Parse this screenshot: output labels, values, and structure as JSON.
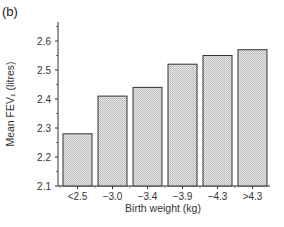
{
  "panel_label": "(b)",
  "chart_data": {
    "type": "bar",
    "title": "",
    "xlabel": "Birth weight (kg)",
    "ylabel": "Mean FEV₁ (litres)",
    "categories": [
      "<2.5",
      "−3.0",
      "−3.4",
      "−3.9",
      "−4.3",
      ">4.3"
    ],
    "values": [
      2.28,
      2.41,
      2.44,
      2.52,
      2.55,
      2.57
    ],
    "ylim": [
      2.1,
      2.65
    ],
    "yticks": [
      2.1,
      2.2,
      2.3,
      2.4,
      2.5,
      2.6
    ],
    "ytick_labels": [
      "2.1",
      "2.2",
      "2.3",
      "2.4",
      "2.5",
      "2.6"
    ],
    "grid": false,
    "legend": null,
    "bar_fill": "hatched light grey",
    "bar_color": "#cfcfcf",
    "edge_color": "#333333"
  }
}
